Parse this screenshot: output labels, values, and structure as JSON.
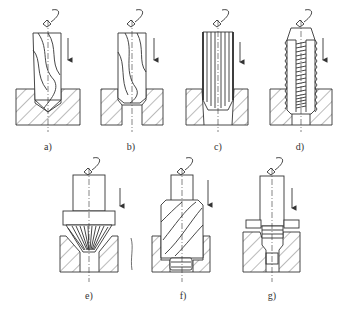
{
  "figure": {
    "stroke_color": "#333333",
    "hatch_color": "#555555",
    "background": "#ffffff",
    "panels": [
      {
        "id": "a",
        "label": "a)",
        "tool": "twist drill",
        "operation": "drilling"
      },
      {
        "id": "b",
        "label": "b)",
        "tool": "core drill",
        "operation": "core drilling / enlarging"
      },
      {
        "id": "c",
        "label": "c)",
        "tool": "reamer",
        "operation": "reaming"
      },
      {
        "id": "d",
        "label": "d)",
        "tool": "tap",
        "operation": "tapping"
      },
      {
        "id": "e",
        "label": "e)",
        "tool": "countersink",
        "operation": "countersinking"
      },
      {
        "id": "f",
        "label": "f)",
        "tool": "counterbore",
        "operation": "counterboring"
      },
      {
        "id": "g",
        "label": "g)",
        "tool": "spot facer",
        "operation": "spot facing"
      }
    ]
  }
}
